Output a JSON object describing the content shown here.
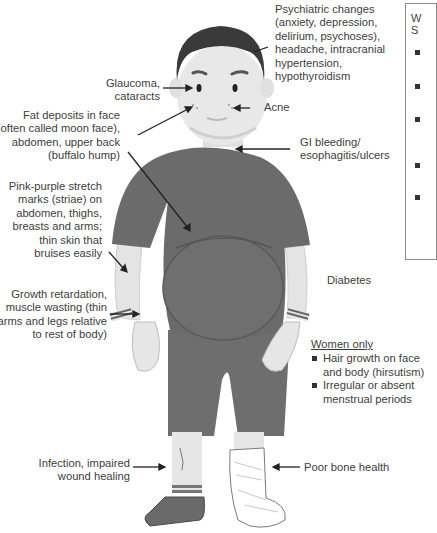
{
  "labels": {
    "psychiatric": [
      "Psychiatric changes",
      "(anxiety, depression,",
      "delirium, psychoses),",
      "headache, intracranial",
      "hypertension,",
      "hypothyroidism"
    ],
    "glaucoma": [
      "Glaucoma,",
      "cataracts"
    ],
    "acne": [
      "Acne"
    ],
    "fat_deposits": [
      "Fat deposits in face",
      "(often called moon face),",
      "abdomen, upper back",
      "(buffalo hump)"
    ],
    "gi": [
      "GI bleeding/",
      "esophagitis/ulcers"
    ],
    "striae": [
      "Pink-purple stretch",
      "marks (striae) on",
      "abdomen, thighs,",
      "breasts and arms;",
      "thin skin that",
      "bruises easily"
    ],
    "diabetes": [
      "Diabetes"
    ],
    "growth": [
      "Growth retardation,",
      "muscle wasting (thin",
      "arms and legs relative",
      "to rest of body)"
    ],
    "infection": [
      "Infection, impaired",
      "wound healing"
    ],
    "bone": [
      "Poor bone health"
    ]
  },
  "women_only": {
    "title": "Women only",
    "items": [
      "Hair growth on face and body (hirsutism)",
      "Irregular or absent menstrual periods"
    ]
  },
  "side_box": {
    "heading_partial": [
      "W",
      "S"
    ],
    "bullet_count": 5
  },
  "colors": {
    "shirt": "#6b6b6b",
    "skin": "#e6e6e6",
    "hair": "#3a3a3a",
    "shorts": "#6e6e6e",
    "text": "#3d3d3d"
  }
}
